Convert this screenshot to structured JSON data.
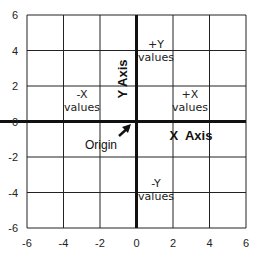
{
  "chart_data": {
    "type": "diagram",
    "title": "",
    "xlim": [
      -6,
      6
    ],
    "ylim": [
      -6,
      6
    ],
    "grid": true,
    "grid_step": 2,
    "x_ticks": [
      "-6",
      "-4",
      "-2",
      "0",
      "2",
      "4",
      "6"
    ],
    "y_ticks": [
      "6",
      "4",
      "2",
      "0",
      "-2",
      "-4",
      "-6"
    ],
    "annotations": {
      "neg_x": [
        "-X",
        "values"
      ],
      "pos_x": [
        "+X",
        "values"
      ],
      "pos_y": [
        "+Y",
        "values"
      ],
      "neg_y": [
        "-Y",
        "values"
      ],
      "x_axis_label": "X  Axis",
      "y_axis_label": "Y Axis",
      "origin_label": "Origin"
    }
  },
  "colors": {
    "grid": "#222222",
    "axis": "#111111",
    "background": "#ffffff"
  }
}
